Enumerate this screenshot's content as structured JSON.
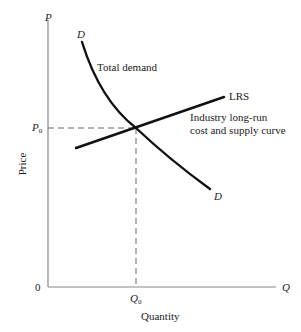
{
  "diagram": {
    "axes": {
      "y_axis_symbol": "P",
      "x_axis_symbol": "Q",
      "origin_label": "0",
      "y_axis_title": "Price",
      "x_axis_title": "Quantity",
      "axis_color": "#888888"
    },
    "equilibrium": {
      "price_label_base": "P",
      "price_label_sub": "0",
      "quantity_label_base": "Q",
      "quantity_label_sub": "0"
    },
    "curves": {
      "demand": {
        "start_label": "D",
        "end_label": "D",
        "description": "Total demand",
        "color": "#111111"
      },
      "supply": {
        "label": "LRS",
        "description": "Industry long-run\ncost and supply curve",
        "color": "#111111"
      }
    },
    "guide_line_color": "#666666"
  }
}
